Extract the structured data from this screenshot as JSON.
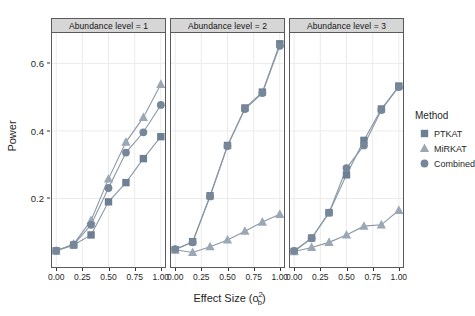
{
  "chart_data": {
    "type": "line",
    "title": "",
    "xlabel": "Effect Size (σ²b)",
    "xlabel_parts": {
      "base": "Effect Size (o",
      "sup": "2",
      "sub": "b",
      "close": ")"
    },
    "ylabel": "Power",
    "xlim": [
      -0.04,
      1.04
    ],
    "ylim": [
      0.0,
      0.69
    ],
    "x": [
      0.0,
      0.1667,
      0.3333,
      0.5,
      0.6667,
      0.8333,
      1.0
    ],
    "xticks": [
      "0.00",
      "0.25",
      "0.50",
      "0.75",
      "1.00"
    ],
    "xtick_values": [
      0.0,
      0.25,
      0.5,
      0.75,
      1.0
    ],
    "yticks": [
      "0.2",
      "0.4",
      "0.6"
    ],
    "ytick_values": [
      0.2,
      0.4,
      0.6
    ],
    "grid": true,
    "legend_position": "right",
    "legend_title": "Method",
    "facet_label_prefix": "Abundance level =",
    "series_order": [
      "PTKAT",
      "MiRKAT",
      "Combined"
    ],
    "markers": {
      "PTKAT": "square",
      "MiRKAT": "triangle",
      "Combined": "circle"
    },
    "colors": {
      "PTKAT": "#6d7f93",
      "MiRKAT": "#9aa7b4",
      "Combined": "#77879a",
      "line": "#8a97a5",
      "grid": "#ebebeb",
      "strip_bg": "#d6d6d6",
      "panel_border": "#5a5a5a",
      "panel_bg": "#ffffff"
    },
    "panels": [
      {
        "facet_value": "1",
        "strip_label": "Abundance level = 1",
        "series": [
          {
            "name": "PTKAT",
            "values": [
              0.045,
              0.062,
              0.092,
              0.19,
              0.247,
              0.318,
              0.383
            ]
          },
          {
            "name": "MiRKAT",
            "values": [
              0.045,
              0.065,
              0.135,
              0.258,
              0.367,
              0.44,
              0.538
            ]
          },
          {
            "name": "Combined",
            "values": [
              0.045,
              0.063,
              0.122,
              0.231,
              0.336,
              0.396,
              0.477
            ]
          }
        ]
      },
      {
        "facet_value": "2",
        "strip_label": "Abundance level = 2",
        "series": [
          {
            "name": "PTKAT",
            "values": [
              0.048,
              0.072,
              0.208,
              0.357,
              0.468,
              0.515,
              0.658
            ]
          },
          {
            "name": "MiRKAT",
            "values": [
              0.048,
              0.04,
              0.057,
              0.077,
              0.103,
              0.13,
              0.153
            ]
          },
          {
            "name": "Combined",
            "values": [
              0.05,
              0.07,
              0.206,
              0.355,
              0.465,
              0.512,
              0.652
            ]
          }
        ]
      },
      {
        "facet_value": "3",
        "strip_label": "Abundance level = 3",
        "series": [
          {
            "name": "PTKAT",
            "values": [
              0.043,
              0.083,
              0.158,
              0.27,
              0.372,
              0.465,
              0.533
            ]
          },
          {
            "name": "MiRKAT",
            "values": [
              0.043,
              0.055,
              0.07,
              0.092,
              0.118,
              0.122,
              0.165
            ]
          },
          {
            "name": "Combined",
            "values": [
              0.045,
              0.082,
              0.158,
              0.29,
              0.357,
              0.462,
              0.53
            ]
          }
        ]
      }
    ]
  },
  "legend": {
    "title": "Method",
    "items": [
      {
        "label": "PTKAT",
        "marker": "square",
        "color": "#6d7f93"
      },
      {
        "label": "MiRKAT",
        "marker": "triangle",
        "color": "#9aa7b4"
      },
      {
        "label": "Combined",
        "marker": "circle",
        "color": "#77879a"
      }
    ]
  }
}
